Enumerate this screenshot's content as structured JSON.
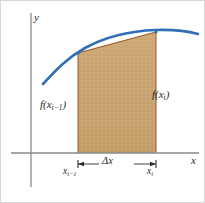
{
  "figure": {
    "background_color": "#ffffff",
    "border_color": "#d8d8d8"
  },
  "axes": {
    "y_axis_label": "y",
    "x_axis_label": "x",
    "axis_color": "#8a8a8a",
    "y_axis_x_px": 30,
    "y_axis_top_px": 12,
    "y_axis_bottom_px": 186,
    "x_axis_y_px": 152,
    "x_axis_left_px": 10,
    "x_axis_right_px": 198
  },
  "curve": {
    "name": "f",
    "color": "#2f6fb5",
    "stroke_width": 2.6,
    "description": "concave-down increasing curve f(x)",
    "path_points": [
      [
        42,
        83
      ],
      [
        62,
        64
      ],
      [
        84,
        48
      ],
      [
        108,
        38
      ],
      [
        132,
        32
      ],
      [
        155,
        29
      ],
      [
        175,
        29
      ],
      [
        197,
        33
      ]
    ]
  },
  "region": {
    "name": "trapezoid",
    "fill_color": "#c8a470",
    "fill_color_light": "#d6b684",
    "edge_color": "#9c5a2a",
    "left_x_px": 77,
    "right_x_px": 155,
    "left_top_y_px": 52,
    "right_top_y_px": 31,
    "base_y_px": 152
  },
  "labels": {
    "f_left": {
      "fn": "f(x",
      "sub": "i−1",
      "close": ")"
    },
    "f_right": {
      "fn": "f(x",
      "sub": "i",
      "close": ")"
    },
    "tick_left": {
      "var": "x",
      "sub": "i−1"
    },
    "tick_right": {
      "var": "x",
      "sub": "i"
    },
    "delta_x": "Δx"
  },
  "dimension": {
    "name": "delta-x-dimension",
    "y_px": 163,
    "left_x_px": 77,
    "right_x_px": 155,
    "line_color": "#2b2b2b",
    "tick_half_height_px": 4
  },
  "markers": {
    "left_point": [
      77,
      52
    ],
    "right_point": [
      155,
      31
    ],
    "marker_color": "#2f6fb5"
  }
}
